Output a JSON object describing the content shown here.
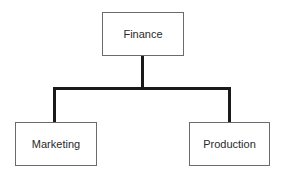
{
  "diagram": {
    "type": "org-chart",
    "root": {
      "label": "Finance"
    },
    "children": [
      {
        "label": "Marketing"
      },
      {
        "label": "Production"
      }
    ]
  },
  "colors": {
    "box_border": "#6b6b6b",
    "connector": "#1a1a1a",
    "text": "#2a2a2a",
    "background": "#ffffff"
  }
}
